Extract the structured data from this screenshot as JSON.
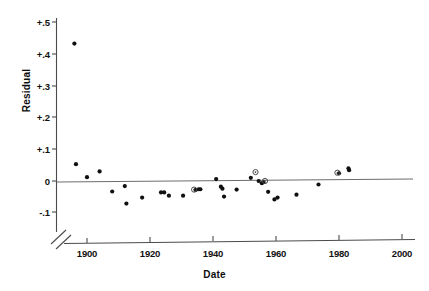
{
  "chart_data": {
    "type": "scatter",
    "title": "",
    "xlabel": "Date",
    "ylabel": "Residual",
    "xlim": [
      1893,
      2003
    ],
    "ylim": [
      -0.13,
      0.52
    ],
    "grid": false,
    "legend": null,
    "axis_break": {
      "axis": "x",
      "note": "broken axis symbol near origin"
    },
    "reference_lines": [
      {
        "orientation": "horizontal",
        "value": 0.0
      }
    ],
    "xticks": [
      1900,
      1920,
      1940,
      1960,
      1980,
      2000
    ],
    "xtick_labels": [
      "1900",
      "1920",
      "1940",
      "1960",
      "1980",
      "2000"
    ],
    "yticks": [
      -0.1,
      0.0,
      0.1,
      0.2,
      0.3,
      0.4,
      0.5
    ],
    "ytick_labels": [
      "-.1",
      "0",
      "+.1",
      "+.2",
      "+.3",
      "+.4",
      "+.5"
    ],
    "series": [
      {
        "name": "residuals-filled",
        "marker": "filled-circle",
        "color": "#101010",
        "points": [
          {
            "x": 1896.0,
            "y": 0.432
          },
          {
            "x": 1896.5,
            "y": 0.053
          },
          {
            "x": 1900.0,
            "y": 0.012
          },
          {
            "x": 1904.0,
            "y": 0.03
          },
          {
            "x": 1908.0,
            "y": -0.033
          },
          {
            "x": 1912.0,
            "y": -0.016
          },
          {
            "x": 1912.5,
            "y": -0.071
          },
          {
            "x": 1917.5,
            "y": -0.052
          },
          {
            "x": 1923.5,
            "y": -0.036
          },
          {
            "x": 1924.5,
            "y": -0.036
          },
          {
            "x": 1926.0,
            "y": -0.046
          },
          {
            "x": 1930.5,
            "y": -0.046
          },
          {
            "x": 1934.5,
            "y": -0.028
          },
          {
            "x": 1935.5,
            "y": -0.026
          },
          {
            "x": 1936.0,
            "y": -0.026
          },
          {
            "x": 1941.0,
            "y": 0.006
          },
          {
            "x": 1942.5,
            "y": -0.018
          },
          {
            "x": 1943.0,
            "y": -0.024
          },
          {
            "x": 1943.5,
            "y": -0.049
          },
          {
            "x": 1947.5,
            "y": -0.027
          },
          {
            "x": 1952.0,
            "y": 0.01
          },
          {
            "x": 1954.5,
            "y": 0.0
          },
          {
            "x": 1955.5,
            "y": -0.007
          },
          {
            "x": 1956.0,
            "y": -0.004
          },
          {
            "x": 1957.5,
            "y": -0.034
          },
          {
            "x": 1959.5,
            "y": -0.058
          },
          {
            "x": 1960.5,
            "y": -0.052
          },
          {
            "x": 1966.5,
            "y": -0.043
          },
          {
            "x": 1973.5,
            "y": -0.011
          },
          {
            "x": 1980.0,
            "y": 0.024
          },
          {
            "x": 1983.0,
            "y": 0.04
          },
          {
            "x": 1983.2,
            "y": 0.034
          }
        ]
      },
      {
        "name": "residuals-open",
        "marker": "open-circle",
        "color": "#4a4a4a",
        "points": [
          {
            "x": 1934.0,
            "y": -0.027
          },
          {
            "x": 1953.5,
            "y": 0.028
          },
          {
            "x": 1956.5,
            "y": 0.0
          },
          {
            "x": 1979.5,
            "y": 0.026
          }
        ]
      }
    ]
  },
  "axis": {
    "ylabel_text": "Residual",
    "xlabel_text": "Date",
    "ytick_labels": [
      "+.5",
      "+.4",
      "+.3",
      "+.2",
      "+.1",
      "0",
      "-.1"
    ],
    "xtick_labels": [
      "1900",
      "1920",
      "1940",
      "1960",
      "1980",
      "2000"
    ]
  }
}
